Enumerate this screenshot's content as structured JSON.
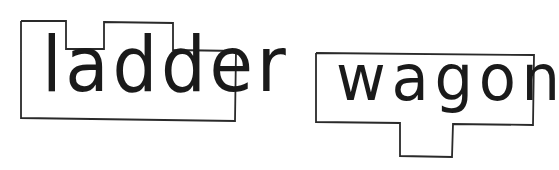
{
  "cards": [
    {
      "word": "ladder",
      "shape": "ascender-notched-box",
      "outline_color": "#2a2a2a"
    },
    {
      "word": "wagon",
      "shape": "descender-tab-box",
      "outline_color": "#2a2a2a"
    }
  ]
}
